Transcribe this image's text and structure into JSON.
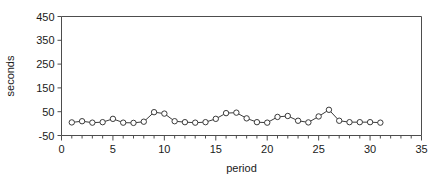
{
  "chart_data": {
    "type": "line",
    "title": "",
    "xlabel": "period",
    "ylabel": "seconds",
    "xlim": [
      0,
      35
    ],
    "ylim": [
      -50,
      450
    ],
    "grid": false,
    "legend": "none",
    "x_major_ticks": [
      0,
      5,
      10,
      15,
      20,
      25,
      30,
      35
    ],
    "x_major_tick_labels": [
      "0",
      "5",
      "10",
      "15",
      "20",
      "25",
      "30",
      "35"
    ],
    "x_minor_tick_step": 1,
    "y_ticks": [
      -50,
      50,
      150,
      250,
      350,
      450
    ],
    "y_tick_labels": [
      "-50",
      "50",
      "150",
      "250",
      "350",
      "450"
    ],
    "marker": "open-circle",
    "line_color": "#3a3a3a",
    "marker_edge_color": "#3a3a3a",
    "marker_face_color": "#ffffff",
    "axis_color": "#4d4d4d",
    "background_color": "#ffffff",
    "series": [
      {
        "name": "series-1",
        "x": [
          1,
          2,
          3,
          4,
          5,
          6,
          7,
          8,
          9,
          10,
          11,
          12,
          13,
          14,
          15,
          16,
          17,
          18,
          19,
          20,
          21,
          22,
          23,
          24,
          25,
          26,
          27,
          28,
          29,
          30,
          31
        ],
        "values": [
          5,
          10,
          4,
          6,
          20,
          4,
          3,
          8,
          48,
          42,
          10,
          6,
          4,
          6,
          20,
          44,
          46,
          22,
          6,
          4,
          28,
          32,
          12,
          5,
          30,
          58,
          12,
          6,
          6,
          6,
          4
        ]
      }
    ]
  }
}
